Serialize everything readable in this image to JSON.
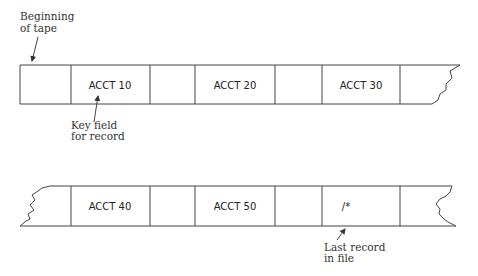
{
  "annotations": {
    "beginning_of_tape": [
      "Beginning",
      "of tape"
    ],
    "key_field": [
      "Key field",
      "for record"
    ],
    "last_record": [
      "Last record",
      "in file"
    ]
  },
  "tape_top": {
    "records": [
      "ACCT 10",
      "ACCT 20",
      "ACCT 30"
    ]
  },
  "tape_bottom": {
    "records": [
      "ACCT 40",
      "ACCT 50",
      "/*"
    ]
  }
}
